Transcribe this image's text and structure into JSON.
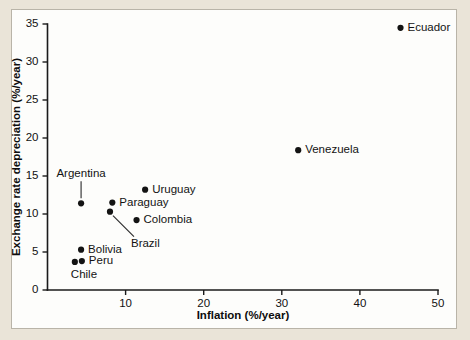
{
  "chart_data": {
    "type": "scatter",
    "title": "",
    "xlabel": "Inflation (%/year)",
    "ylabel": "Exchange rate depreciation (%/year)",
    "xlim": [
      0,
      50
    ],
    "ylim": [
      0,
      35
    ],
    "xticks": [
      10,
      20,
      30,
      40,
      50
    ],
    "yticks": [
      0,
      5,
      10,
      15,
      20,
      25,
      30,
      35
    ],
    "grid": false,
    "legend": "none",
    "point_color": "#131313",
    "points": [
      {
        "label": "Ecuador",
        "x": 45.2,
        "y": 34.5,
        "label_pos": "right"
      },
      {
        "label": "Venezuela",
        "x": 32.1,
        "y": 18.4,
        "label_pos": "right"
      },
      {
        "label": "Uruguay",
        "x": 12.5,
        "y": 13.2,
        "label_pos": "right"
      },
      {
        "label": "Paraguay",
        "x": 8.3,
        "y": 11.5,
        "label_pos": "right"
      },
      {
        "label": "Argentina",
        "x": 4.3,
        "y": 11.4,
        "label_pos": "leader-up"
      },
      {
        "label": "Brazil",
        "x": 8.0,
        "y": 10.3,
        "label_pos": "leader-diagonal"
      },
      {
        "label": "Colombia",
        "x": 11.4,
        "y": 9.2,
        "label_pos": "right"
      },
      {
        "label": "Bolivia",
        "x": 4.3,
        "y": 5.3,
        "label_pos": "right"
      },
      {
        "label": "Peru",
        "x": 4.4,
        "y": 3.8,
        "label_pos": "right"
      },
      {
        "label": "Chile",
        "x": 3.5,
        "y": 3.7,
        "label_pos": "below"
      }
    ]
  },
  "axes": {
    "x_tick_labels": [
      "10",
      "20",
      "30",
      "40",
      "50"
    ],
    "y_tick_labels": [
      "0",
      "5",
      "10",
      "15",
      "20",
      "25",
      "30",
      "35"
    ],
    "x_title": "Inflation (%/year)",
    "y_title": "Exchange rate depreciation (%/year)"
  },
  "point_labels": {
    "ecuador": "Ecuador",
    "venezuela": "Venezuela",
    "uruguay": "Uruguay",
    "paraguay": "Paraguay",
    "argentina": "Argentina",
    "brazil": "Brazil",
    "colombia": "Colombia",
    "bolivia": "Bolivia",
    "peru": "Peru",
    "chile": "Chile"
  },
  "colors": {
    "page_background": "#eae4d8",
    "panel_background": "#fdfdfb",
    "panel_border": "#b9b4a8",
    "ink": "#131313"
  }
}
